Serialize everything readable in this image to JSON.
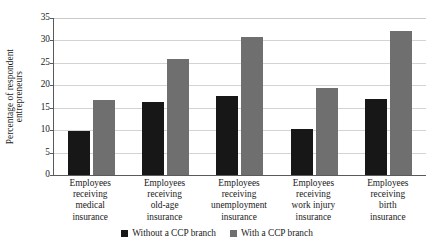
{
  "chart_data": {
    "type": "bar",
    "title": "",
    "subtitle": "",
    "xlabel": "",
    "ylabel": "Percentage of respondent entrepreneurs",
    "ylabel_lines": [
      "Percentage of respondent",
      "entrepreneurs"
    ],
    "ylim": [
      0,
      35
    ],
    "ytick_values": [
      0,
      5,
      10,
      15,
      20,
      25,
      30,
      35
    ],
    "ytick_labels": [
      "0",
      "5",
      "10",
      "15",
      "20",
      "25",
      "30",
      "35"
    ],
    "grid": true,
    "grid_axis": "y",
    "legend_position": "bottom-center",
    "categories": [
      "Employees receiving medical insurance",
      "Employees receiving old-age insurance",
      "Employees receiving unemployment insurance",
      "Employees receiving work injury insurance",
      "Employees receiving birth insurance"
    ],
    "category_label_lines": [
      [
        "Employees",
        "receiving",
        "medical",
        "insurance"
      ],
      [
        "Employees",
        "receiving",
        "old-age",
        "insurance"
      ],
      [
        "Employees",
        "receiving",
        "unemployment",
        "insurance"
      ],
      [
        "Employees",
        "receiving",
        "work injury",
        "insurance"
      ],
      [
        "Employees",
        "receiving",
        "birth",
        "insurance"
      ]
    ],
    "series": [
      {
        "name": "Without a CCP branch",
        "color": "#171717",
        "values": [
          9.8,
          16.2,
          17.6,
          10.3,
          17.0
        ]
      },
      {
        "name": "With a CCP branch",
        "color": "#6f6f6f",
        "values": [
          16.8,
          25.8,
          30.7,
          19.4,
          32.2
        ]
      }
    ]
  },
  "legend": {
    "entries": [
      {
        "label": "Without a CCP branch",
        "color": "#171717",
        "swatch_icon": "filled-square-icon"
      },
      {
        "label": "With a CCP branch",
        "color": "#6f6f6f",
        "swatch_icon": "filled-square-icon"
      }
    ]
  },
  "colors": {
    "series_a": "#171717",
    "series_b": "#6f6f6f",
    "gridline": "#d4d4d4",
    "axis": "#5a5a5a",
    "text": "#1a1a1a",
    "background": "#ffffff"
  }
}
